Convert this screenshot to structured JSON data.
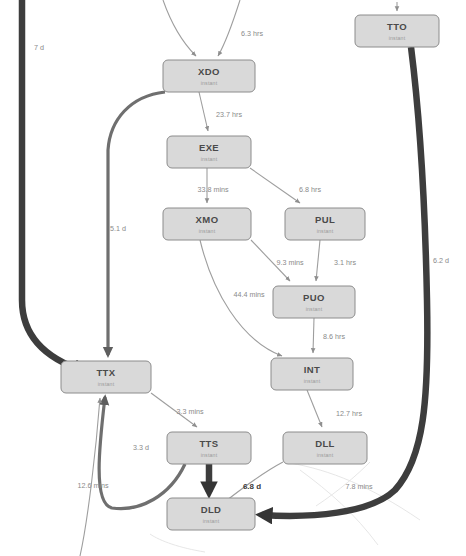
{
  "diagram": {
    "background_color": "#ffffff",
    "node_fill": "#d9d9d9",
    "node_stroke": "#8c8c8c",
    "node_title_color": "#4a4a4a",
    "node_subtitle_color": "#9a9a9a",
    "edge_thin_color": "#9e9e9e",
    "edge_medium_color": "#6f6f6f",
    "edge_thick_color": "#3d3d3d",
    "edge_ghost_color": "#e3e3e3",
    "node_subtitle_default": "instant"
  },
  "nodes": [
    {
      "id": "XDO",
      "label": "XDO",
      "subtitle": "instant",
      "x": 163,
      "y": 60,
      "w": 92,
      "h": 32
    },
    {
      "id": "EXE",
      "label": "EXE",
      "subtitle": "instant",
      "x": 167,
      "y": 136,
      "w": 84,
      "h": 32
    },
    {
      "id": "XMO",
      "label": "XMO",
      "subtitle": "instant",
      "x": 163,
      "y": 208,
      "w": 88,
      "h": 32
    },
    {
      "id": "PUL",
      "label": "PUL",
      "subtitle": "instant",
      "x": 285,
      "y": 208,
      "w": 80,
      "h": 32
    },
    {
      "id": "PUO",
      "label": "PUO",
      "subtitle": "instant",
      "x": 273,
      "y": 286,
      "w": 82,
      "h": 32
    },
    {
      "id": "INT",
      "label": "INT",
      "subtitle": "instant",
      "x": 271,
      "y": 358,
      "w": 82,
      "h": 32
    },
    {
      "id": "TTX",
      "label": "TTX",
      "subtitle": "instant",
      "x": 61,
      "y": 361,
      "w": 90,
      "h": 32
    },
    {
      "id": "TTS",
      "label": "TTS",
      "subtitle": "instant",
      "x": 167,
      "y": 432,
      "w": 84,
      "h": 32
    },
    {
      "id": "DLL",
      "label": "DLL",
      "subtitle": "instant",
      "x": 283,
      "y": 432,
      "w": 84,
      "h": 32
    },
    {
      "id": "DLD",
      "label": "DLD",
      "subtitle": "instant",
      "x": 167,
      "y": 498,
      "w": 88,
      "h": 32
    },
    {
      "id": "TTO",
      "label": "TTO",
      "subtitle": "instant",
      "x": 355,
      "y": 15,
      "w": 84,
      "h": 32
    }
  ],
  "edges": [
    {
      "id": "in-left-xdo",
      "from": "(external)",
      "to": "XDO",
      "label": "",
      "weight": "thin"
    },
    {
      "id": "in-right-xdo",
      "from": "(external)",
      "to": "XDO",
      "label": "6.3 hrs",
      "weight": "thin",
      "label_x": 252,
      "label_y": 34
    },
    {
      "id": "xdo-exe",
      "from": "XDO",
      "to": "EXE",
      "label": "23.7 hrs",
      "weight": "thin",
      "label_x": 227,
      "label_y": 115
    },
    {
      "id": "exe-xmo",
      "from": "EXE",
      "to": "XMO",
      "label": "33.8 mins",
      "weight": "thin",
      "label_x": 213,
      "label_y": 190
    },
    {
      "id": "exe-pul",
      "from": "EXE",
      "to": "PUL",
      "label": "6.8 hrs",
      "weight": "thin",
      "label_x": 307,
      "label_y": 190
    },
    {
      "id": "xmo-puo",
      "from": "XMO",
      "to": "PUO",
      "label": "44.4 mins",
      "weight": "thin",
      "label_x": 249,
      "label_y": 295
    },
    {
      "id": "xmo-int",
      "from": "XMO",
      "to": "INT",
      "label": "9.3 mins",
      "weight": "thin",
      "label_x": 290,
      "label_y": 263
    },
    {
      "id": "pul-puo",
      "from": "PUL",
      "to": "PUO",
      "label": "3.1 hrs",
      "weight": "thin",
      "label_x": 344,
      "label_y": 263
    },
    {
      "id": "puo-int",
      "from": "PUO",
      "to": "INT",
      "label": "8.6 hrs",
      "weight": "thin",
      "label_x": 333,
      "label_y": 337
    },
    {
      "id": "int-dll",
      "from": "INT",
      "to": "DLL",
      "label": "12.7 hrs",
      "weight": "thin",
      "label_x": 348,
      "label_y": 414
    },
    {
      "id": "ttx-tts",
      "from": "TTX",
      "to": "TTS",
      "label": "3.3 mins",
      "weight": "thin",
      "label_x": 190,
      "label_y": 412
    },
    {
      "id": "dll-ttx",
      "from": "DLL",
      "to": "TTX",
      "label": "7.8 mins",
      "weight": "thin",
      "label_x": 359,
      "label_y": 487
    },
    {
      "id": "dld-ttx",
      "from": "DLD",
      "to": "TTX",
      "label": "12.6 mins",
      "weight": "thin",
      "label_x": 93,
      "label_y": 486
    },
    {
      "id": "tts-ttx",
      "from": "TTS",
      "to": "TTX",
      "label": "3.3 d",
      "weight": "med",
      "label_x": 139,
      "label_y": 448
    },
    {
      "id": "tts-dld",
      "from": "TTS",
      "to": "DLD",
      "label": "6.8 d",
      "weight": "thick",
      "label_x": 250,
      "label_y": 487,
      "bold": true
    },
    {
      "id": "xdo-ttx",
      "from": "XDO",
      "to": "TTX",
      "label": "5.1 d",
      "weight": "med",
      "label_x": 118,
      "label_y": 229
    },
    {
      "id": "far-left",
      "from": "(external)",
      "to": "TTX",
      "label": "7 d",
      "weight": "thick",
      "label_x": 38,
      "label_y": 48
    },
    {
      "id": "tto-dld",
      "from": "TTO",
      "to": "DLD",
      "label": "6.2 d",
      "weight": "thick",
      "label_x": 440,
      "label_y": 261
    },
    {
      "id": "in-tto",
      "from": "(external)",
      "to": "TTO",
      "label": "",
      "weight": "thin"
    }
  ],
  "edge_labels": [
    "6.3 hrs",
    "23.7 hrs",
    "33.8 mins",
    "6.8 hrs",
    "9.3 mins",
    "3.1 hrs",
    "44.4 mins",
    "8.6 hrs",
    "12.7 hrs",
    "3.3 mins",
    "3.3 d",
    "12.6 mins",
    "6.8 d",
    "7.8 mins",
    "5.1 d",
    "7 d",
    "6.2 d"
  ]
}
